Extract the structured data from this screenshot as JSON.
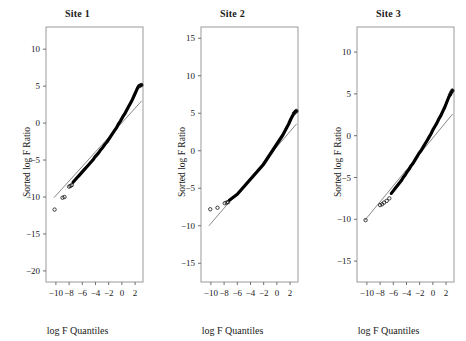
{
  "figure": {
    "xlabel": "log F Quantiles",
    "ylabel": "Sorted log F Ratio"
  },
  "chart_data": [
    {
      "type": "scatter",
      "title": "Site 1",
      "xlabel": "log F Quantiles",
      "ylabel": "Sorted log F Ratio",
      "xlim": [
        -11.5,
        3.2
      ],
      "ylim": [
        -21.5,
        13.0
      ],
      "xticks": [
        -10,
        -8,
        -6,
        -4,
        -2,
        0,
        2
      ],
      "yticks": [
        10,
        5,
        0,
        -5,
        -10,
        -15,
        -20
      ],
      "grid": false,
      "legend": null,
      "reference_line": {
        "x": [
          -10.3,
          3.0
        ],
        "y": [
          -10.1,
          3.0
        ]
      },
      "outliers": [
        {
          "x": -10.2,
          "y": -11.7
        },
        {
          "x": -9.0,
          "y": -10.1
        },
        {
          "x": -8.7,
          "y": -10.0
        },
        {
          "x": -8.0,
          "y": -8.6
        },
        {
          "x": -7.8,
          "y": -8.5
        },
        {
          "x": -7.6,
          "y": -8.4
        }
      ],
      "points": {
        "x": [
          -7.4,
          -7.1,
          -6.8,
          -6.5,
          -6.2,
          -5.9,
          -5.6,
          -5.3,
          -5.0,
          -4.7,
          -4.4,
          -4.1,
          -3.8,
          -3.5,
          -3.2,
          -2.9,
          -2.6,
          -2.3,
          -2.0,
          -1.7,
          -1.4,
          -1.1,
          -0.8,
          -0.5,
          -0.2,
          0.1,
          0.4,
          0.7,
          1.0,
          1.3,
          1.6,
          1.9,
          2.2,
          2.4,
          2.6,
          2.8,
          2.95
        ],
        "y": [
          -8.0,
          -7.7,
          -7.4,
          -7.1,
          -6.8,
          -6.5,
          -6.2,
          -5.9,
          -5.6,
          -5.3,
          -5.0,
          -4.6,
          -4.3,
          -4.0,
          -3.6,
          -3.3,
          -2.9,
          -2.6,
          -2.2,
          -1.8,
          -1.4,
          -1.0,
          -0.6,
          -0.1,
          0.3,
          0.8,
          1.2,
          1.7,
          2.2,
          2.7,
          3.2,
          3.8,
          4.4,
          4.8,
          5.0,
          5.1,
          5.15
        ]
      }
    },
    {
      "type": "scatter",
      "title": "Site 2",
      "xlabel": "log F Quantiles",
      "ylabel": "Sorted log F Ratio",
      "xlim": [
        -11.5,
        3.2
      ],
      "ylim": [
        -17.5,
        16.5
      ],
      "xticks": [
        -10,
        -8,
        -6,
        -4,
        -2,
        0,
        2
      ],
      "yticks": [
        15,
        10,
        5,
        0,
        -5,
        -10,
        -15
      ],
      "grid": false,
      "legend": null,
      "reference_line": {
        "x": [
          -10.3,
          3.0
        ],
        "y": [
          -10.0,
          3.6
        ]
      },
      "outliers": [
        {
          "x": -10.1,
          "y": -7.8
        },
        {
          "x": -9.0,
          "y": -7.6
        },
        {
          "x": -7.9,
          "y": -7.0
        },
        {
          "x": -7.6,
          "y": -6.9
        },
        {
          "x": -7.4,
          "y": -6.85
        }
      ],
      "points": {
        "x": [
          -7.2,
          -6.9,
          -6.6,
          -6.3,
          -6.0,
          -5.7,
          -5.4,
          -5.1,
          -4.8,
          -4.5,
          -4.2,
          -3.9,
          -3.6,
          -3.3,
          -3.0,
          -2.7,
          -2.4,
          -2.1,
          -1.8,
          -1.5,
          -1.2,
          -0.9,
          -0.6,
          -0.3,
          0.0,
          0.3,
          0.6,
          0.9,
          1.2,
          1.5,
          1.8,
          2.1,
          2.4,
          2.6,
          2.8,
          2.95
        ],
        "y": [
          -6.6,
          -6.4,
          -6.2,
          -6.0,
          -5.8,
          -5.5,
          -5.2,
          -4.9,
          -4.6,
          -4.3,
          -4.0,
          -3.7,
          -3.4,
          -3.1,
          -2.8,
          -2.5,
          -2.2,
          -1.9,
          -1.5,
          -1.1,
          -0.7,
          -0.3,
          0.1,
          0.5,
          0.9,
          1.3,
          1.7,
          2.1,
          2.6,
          3.1,
          3.6,
          4.2,
          4.7,
          5.0,
          5.2,
          5.3
        ]
      }
    },
    {
      "type": "scatter",
      "title": "Site 3",
      "xlabel": "log F Quantiles",
      "ylabel": "Sorted log F Ratio",
      "xlim": [
        -11.5,
        3.2
      ],
      "ylim": [
        -17.5,
        13.0
      ],
      "xticks": [
        -10,
        -8,
        -6,
        -4,
        -2,
        0,
        2
      ],
      "yticks": [
        10,
        5,
        0,
        -5,
        -10,
        -15
      ],
      "grid": false,
      "legend": null,
      "reference_line": {
        "x": [
          -10.3,
          3.0
        ],
        "y": [
          -10.1,
          2.6
        ]
      },
      "outliers": [
        {
          "x": -10.2,
          "y": -10.1
        },
        {
          "x": -8.0,
          "y": -8.3
        },
        {
          "x": -7.7,
          "y": -8.2
        },
        {
          "x": -7.4,
          "y": -8.0
        },
        {
          "x": -7.0,
          "y": -7.8
        },
        {
          "x": -6.6,
          "y": -7.5
        }
      ],
      "points": {
        "x": [
          -6.3,
          -6.0,
          -5.7,
          -5.4,
          -5.1,
          -4.8,
          -4.5,
          -4.2,
          -3.9,
          -3.6,
          -3.3,
          -3.0,
          -2.7,
          -2.4,
          -2.1,
          -1.8,
          -1.5,
          -1.2,
          -0.9,
          -0.6,
          -0.3,
          0.0,
          0.3,
          0.6,
          0.9,
          1.2,
          1.5,
          1.8,
          2.1,
          2.4,
          2.6,
          2.8,
          2.95
        ],
        "y": [
          -6.9,
          -6.6,
          -6.3,
          -6.0,
          -5.7,
          -5.4,
          -5.0,
          -4.7,
          -4.3,
          -4.0,
          -3.6,
          -3.3,
          -2.9,
          -2.5,
          -2.1,
          -1.8,
          -1.4,
          -1.0,
          -0.6,
          -0.2,
          0.2,
          0.7,
          1.1,
          1.5,
          2.0,
          2.4,
          2.9,
          3.4,
          4.0,
          4.6,
          4.9,
          5.2,
          5.4
        ]
      }
    }
  ]
}
